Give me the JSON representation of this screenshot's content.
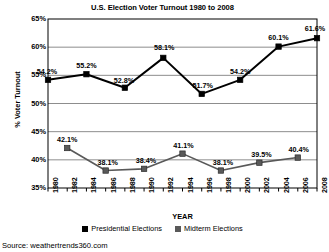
{
  "chart_data": {
    "type": "line",
    "title": "U.S. Election Voter Turnout 1980 to 2008",
    "xlabel": "YEAR",
    "ylabel": "% Voter Turnout",
    "ylim": [
      35,
      65
    ],
    "ytick_labels": [
      "65%",
      "60%",
      "55%",
      "50%",
      "45%",
      "40%",
      "35%"
    ],
    "ytick_values": [
      65,
      60,
      55,
      50,
      45,
      40,
      35
    ],
    "xlim": [
      1980,
      2008
    ],
    "x": [
      1980,
      1982,
      1984,
      1986,
      1988,
      1990,
      1992,
      1994,
      1996,
      1998,
      2000,
      2002,
      2004,
      2006,
      2008
    ],
    "xtick_labels": [
      "1980",
      "1982",
      "1984",
      "1986",
      "1988",
      "1990",
      "1992",
      "1994",
      "1996",
      "1998",
      "2000",
      "2002",
      "2004",
      "2006",
      "2008"
    ],
    "grid": true,
    "grid_axis": "y",
    "legend_position": "bottom",
    "series": [
      {
        "name": "Presidential Elections",
        "color": "#000000",
        "marker": "square",
        "points": [
          {
            "x": 1980,
            "y": 54.2,
            "label": "54.2%"
          },
          {
            "x": 1984,
            "y": 55.2,
            "label": "55.2%"
          },
          {
            "x": 1988,
            "y": 52.8,
            "label": "52.8%"
          },
          {
            "x": 1992,
            "y": 58.1,
            "label": "58.1%"
          },
          {
            "x": 1996,
            "y": 51.7,
            "label": "51.7%"
          },
          {
            "x": 2000,
            "y": 54.2,
            "label": "54.2%"
          },
          {
            "x": 2004,
            "y": 60.1,
            "label": "60.1%"
          },
          {
            "x": 2008,
            "y": 61.6,
            "label": "61.6%"
          }
        ]
      },
      {
        "name": "Midterm Elections",
        "color": "#595959",
        "marker": "square",
        "points": [
          {
            "x": 1982,
            "y": 42.1,
            "label": "42.1%"
          },
          {
            "x": 1986,
            "y": 38.1,
            "label": "38.1%"
          },
          {
            "x": 1990,
            "y": 38.4,
            "label": "38.4%"
          },
          {
            "x": 1994,
            "y": 41.1,
            "label": "41.1%"
          },
          {
            "x": 1998,
            "y": 38.1,
            "label": "38.1%"
          },
          {
            "x": 2002,
            "y": 39.5,
            "label": "39.5%"
          },
          {
            "x": 2006,
            "y": 40.4,
            "label": "40.4%"
          }
        ]
      }
    ]
  },
  "legend": {
    "items": [
      {
        "label": "Presidential Elections",
        "color": "#000000"
      },
      {
        "label": "Midterm Elections",
        "color": "#595959"
      }
    ]
  },
  "source": {
    "text": "Source: weathertrends360.com"
  }
}
